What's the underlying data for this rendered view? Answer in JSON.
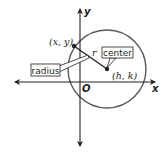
{
  "diagram": {
    "axes": {
      "x_label": "x",
      "y_label": "y",
      "origin_label": "O"
    },
    "circle": {
      "center_label": "(h, k)",
      "point_label": "(x, y)",
      "radius_symbol": "r"
    },
    "callouts": {
      "center": "center",
      "radius": "radius"
    },
    "colors": {
      "stroke": "#231f20",
      "circle": "#58595b",
      "background": "#ffffff"
    }
  }
}
